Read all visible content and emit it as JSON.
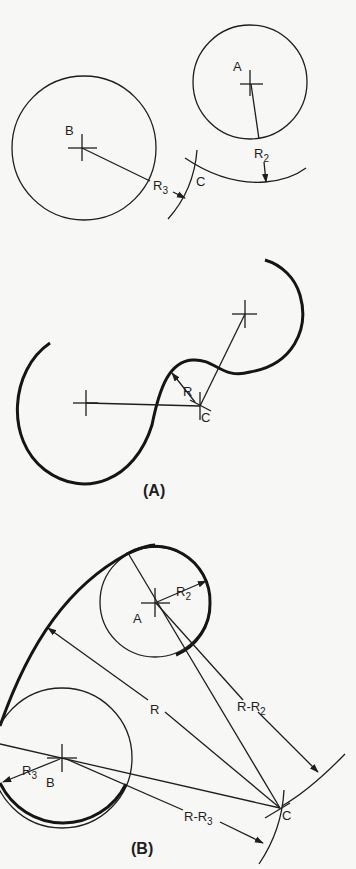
{
  "figure": {
    "panel_top": {
      "labels": {
        "center_a": "A",
        "center_b": "B",
        "intersection_c": "C",
        "radius_2": "R",
        "radius_2_sub": "2",
        "radius_3": "R",
        "radius_3_sub": "3"
      }
    },
    "panel_a": {
      "caption": "(A)",
      "labels": {
        "radius": "R",
        "center_c": "C"
      }
    },
    "panel_b": {
      "caption": "(B)",
      "labels": {
        "center_a": "A",
        "center_b": "B",
        "center_c": "C",
        "radius": "R",
        "radius_2": "R",
        "radius_2_sub": "2",
        "radius_3": "R",
        "radius_3_sub": "3",
        "r_minus_r2": "R-R",
        "r_minus_r2_sub": "2",
        "r_minus_r3": "R-R",
        "r_minus_r3_sub": "3"
      }
    },
    "colors": {
      "background": "#f7f7f5",
      "ink": "#1e1e1e"
    }
  }
}
